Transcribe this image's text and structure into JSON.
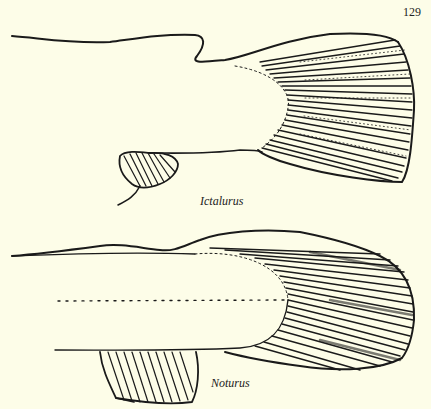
{
  "page": {
    "page_number": "129"
  },
  "figures": [
    {
      "id": "upper",
      "caption": "Ictalurus",
      "subject": "caudal-fin-illustration"
    },
    {
      "id": "lower",
      "caption": "Noturus",
      "subject": "caudal-fin-illustration"
    }
  ],
  "colors": {
    "background": "#fdfde8",
    "ink": "#1a1a1a"
  }
}
